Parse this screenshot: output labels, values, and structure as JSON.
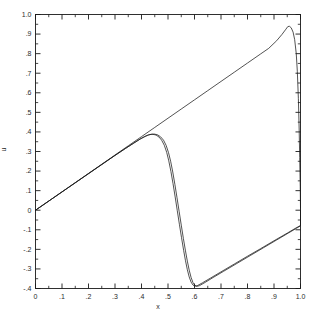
{
  "chart_data": {
    "type": "line",
    "title": "",
    "xlabel": "x",
    "ylabel": "u",
    "xlim": [
      0,
      1.0
    ],
    "ylim": [
      -0.4,
      1.0
    ],
    "grid": false,
    "legend": null,
    "x_ticks": [
      "0",
      ".1",
      ".2",
      ".3",
      ".4",
      ".5",
      ".6",
      ".7",
      ".8",
      ".9",
      "1.0"
    ],
    "x_tick_values": [
      0,
      0.1,
      0.2,
      0.3,
      0.4,
      0.5,
      0.6,
      0.7,
      0.8,
      0.9,
      1.0
    ],
    "y_ticks": [
      "1.0",
      ".9",
      ".8",
      ".7",
      ".6",
      ".5",
      ".4",
      ".3",
      ".2",
      ".1",
      "0",
      "-.1",
      "-.2",
      "-.3",
      "-.4"
    ],
    "y_tick_values": [
      1.0,
      0.9,
      0.8,
      0.7,
      0.6,
      0.5,
      0.4,
      0.3,
      0.2,
      0.1,
      0,
      -0.1,
      -0.2,
      -0.3,
      -0.4
    ],
    "minor_ticks_per_interval": 1,
    "tick_direction": "in",
    "frame": "box",
    "line_color": "#1a1a1a",
    "background_color": "#ffffff",
    "series": [
      {
        "name": "solution-upper",
        "comment": "upper branch: rising sawtooth from origin, peak near x=0.95",
        "points": [
          [
            0.0,
            0.0
          ],
          [
            0.05,
            0.047
          ],
          [
            0.1,
            0.094
          ],
          [
            0.15,
            0.141
          ],
          [
            0.2,
            0.188
          ],
          [
            0.25,
            0.235
          ],
          [
            0.3,
            0.282
          ],
          [
            0.35,
            0.329
          ],
          [
            0.4,
            0.376
          ],
          [
            0.45,
            0.423
          ],
          [
            0.5,
            0.47
          ],
          [
            0.55,
            0.517
          ],
          [
            0.6,
            0.564
          ],
          [
            0.65,
            0.611
          ],
          [
            0.7,
            0.658
          ],
          [
            0.75,
            0.705
          ],
          [
            0.8,
            0.752
          ],
          [
            0.85,
            0.799
          ],
          [
            0.88,
            0.827
          ],
          [
            0.91,
            0.866
          ],
          [
            0.93,
            0.898
          ],
          [
            0.945,
            0.925
          ],
          [
            0.952,
            0.938
          ],
          [
            0.958,
            0.94
          ],
          [
            0.965,
            0.932
          ],
          [
            0.972,
            0.91
          ],
          [
            0.978,
            0.872
          ],
          [
            0.984,
            0.8
          ],
          [
            0.988,
            0.71
          ],
          [
            0.992,
            0.57
          ],
          [
            0.995,
            0.41
          ],
          [
            0.997,
            0.27
          ],
          [
            0.999,
            0.12
          ],
          [
            1.0,
            0.01
          ]
        ]
      },
      {
        "name": "solution-lower",
        "comment": "lower branch: N-wave — rises to 0.39 near x=0.43, steep drop to -0.39 near x=0.59, then linear rise to 0 at x=1.0",
        "points": [
          [
            0.0,
            0.0
          ],
          [
            0.06,
            0.056
          ],
          [
            0.12,
            0.112
          ],
          [
            0.18,
            0.168
          ],
          [
            0.24,
            0.224
          ],
          [
            0.3,
            0.28
          ],
          [
            0.34,
            0.316
          ],
          [
            0.37,
            0.342
          ],
          [
            0.395,
            0.364
          ],
          [
            0.41,
            0.375
          ],
          [
            0.422,
            0.383
          ],
          [
            0.432,
            0.387
          ],
          [
            0.443,
            0.388
          ],
          [
            0.455,
            0.384
          ],
          [
            0.466,
            0.374
          ],
          [
            0.476,
            0.358
          ],
          [
            0.486,
            0.332
          ],
          [
            0.495,
            0.296
          ],
          [
            0.503,
            0.252
          ],
          [
            0.511,
            0.198
          ],
          [
            0.519,
            0.136
          ],
          [
            0.527,
            0.068
          ],
          [
            0.535,
            -0.002
          ],
          [
            0.543,
            -0.072
          ],
          [
            0.551,
            -0.14
          ],
          [
            0.559,
            -0.205
          ],
          [
            0.566,
            -0.258
          ],
          [
            0.573,
            -0.304
          ],
          [
            0.58,
            -0.341
          ],
          [
            0.587,
            -0.367
          ],
          [
            0.594,
            -0.382
          ],
          [
            0.601,
            -0.388
          ],
          [
            0.61,
            -0.386
          ],
          [
            0.63,
            -0.371
          ],
          [
            0.66,
            -0.347
          ],
          [
            0.7,
            -0.315
          ],
          [
            0.75,
            -0.275
          ],
          [
            0.8,
            -0.235
          ],
          [
            0.85,
            -0.196
          ],
          [
            0.9,
            -0.156
          ],
          [
            0.95,
            -0.117
          ],
          [
            0.98,
            -0.093
          ],
          [
            1.0,
            -0.078
          ],
          [
            1.0,
            0.0
          ]
        ]
      },
      {
        "name": "solution-lower-companion",
        "comment": "second nearly-coincident curve offset slightly in x (numerical vs exact)",
        "points": [
          [
            0.0,
            0.0
          ],
          [
            0.06,
            0.056
          ],
          [
            0.12,
            0.112
          ],
          [
            0.18,
            0.168
          ],
          [
            0.24,
            0.224
          ],
          [
            0.3,
            0.28
          ],
          [
            0.34,
            0.316
          ],
          [
            0.372,
            0.344
          ],
          [
            0.398,
            0.366
          ],
          [
            0.414,
            0.377
          ],
          [
            0.426,
            0.384
          ],
          [
            0.437,
            0.388
          ],
          [
            0.449,
            0.389
          ],
          [
            0.461,
            0.385
          ],
          [
            0.472,
            0.375
          ],
          [
            0.483,
            0.358
          ],
          [
            0.493,
            0.331
          ],
          [
            0.502,
            0.294
          ],
          [
            0.51,
            0.25
          ],
          [
            0.518,
            0.195
          ],
          [
            0.526,
            0.132
          ],
          [
            0.534,
            0.064
          ],
          [
            0.542,
            -0.006
          ],
          [
            0.55,
            -0.076
          ],
          [
            0.558,
            -0.144
          ],
          [
            0.566,
            -0.208
          ],
          [
            0.573,
            -0.26
          ],
          [
            0.58,
            -0.306
          ],
          [
            0.587,
            -0.343
          ],
          [
            0.594,
            -0.369
          ],
          [
            0.601,
            -0.383
          ],
          [
            0.608,
            -0.389
          ],
          [
            0.618,
            -0.386
          ],
          [
            0.64,
            -0.369
          ],
          [
            0.67,
            -0.344
          ],
          [
            0.71,
            -0.312
          ],
          [
            0.76,
            -0.272
          ],
          [
            0.81,
            -0.232
          ],
          [
            0.86,
            -0.192
          ],
          [
            0.91,
            -0.152
          ],
          [
            0.955,
            -0.116
          ],
          [
            0.985,
            -0.092
          ],
          [
            1.0,
            -0.08
          ],
          [
            1.0,
            0.0
          ]
        ]
      }
    ]
  }
}
